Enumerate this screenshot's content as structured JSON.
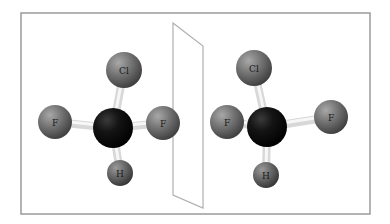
{
  "diagram": {
    "title": "",
    "frame": {
      "x": 21,
      "y": 13,
      "width": 349,
      "height": 201,
      "stroke": "#9a9a9a"
    },
    "mirror_plane": {
      "points": [
        [
          173,
          23
        ],
        [
          203,
          46
        ],
        [
          203,
          208
        ],
        [
          173,
          195
        ]
      ],
      "stroke": "#b0b0b0",
      "fill": "#ffffff"
    },
    "colors": {
      "halogen": "#6e6e6e",
      "carbon": "#111111",
      "hydrogen": "#5e5e5e",
      "bond": "#e8e8e8"
    },
    "molecules": [
      {
        "name": "original",
        "atoms": [
          {
            "id": "C",
            "label": "",
            "x": 113,
            "y": 128,
            "r": 20,
            "type": "carbon"
          },
          {
            "id": "Cl",
            "label": "Cl",
            "x": 124,
            "y": 70,
            "r": 18,
            "type": "halogen"
          },
          {
            "id": "F1",
            "label": "F",
            "x": 55,
            "y": 122,
            "r": 17,
            "type": "halogen"
          },
          {
            "id": "F2",
            "label": "F",
            "x": 163,
            "y": 123,
            "r": 17,
            "type": "halogen"
          },
          {
            "id": "H",
            "label": "H",
            "x": 120,
            "y": 173,
            "r": 13,
            "type": "hydrogen"
          }
        ]
      },
      {
        "name": "mirror-image",
        "atoms": [
          {
            "id": "C",
            "label": "",
            "x": 267,
            "y": 127,
            "r": 20,
            "type": "carbon"
          },
          {
            "id": "Cl",
            "label": "Cl",
            "x": 254,
            "y": 68,
            "r": 18,
            "type": "halogen"
          },
          {
            "id": "F1",
            "label": "F",
            "x": 227,
            "y": 122,
            "r": 17,
            "type": "halogen"
          },
          {
            "id": "F2",
            "label": "F",
            "x": 331,
            "y": 117,
            "r": 17,
            "type": "halogen"
          },
          {
            "id": "H",
            "label": "H",
            "x": 266,
            "y": 175,
            "r": 13,
            "type": "hydrogen"
          }
        ]
      }
    ]
  }
}
